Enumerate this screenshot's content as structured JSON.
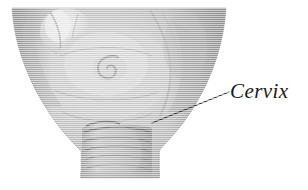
{
  "figure": {
    "type": "anatomical-illustration",
    "subject": "cervix",
    "background_color": "#ffffff",
    "style": "grayscale engraving with horizontal scanline hatching",
    "width": 308,
    "height": 190
  },
  "annotations": [
    {
      "label": "Cervix",
      "text_color": "#1a1a1a",
      "font_style": "italic-serif",
      "text_x": 231,
      "text_baseline_y": 102,
      "leader_line": {
        "from_x": 152,
        "from_y": 123,
        "to_x": 229,
        "to_y": 92,
        "color": "#262626",
        "width": 1.2
      }
    }
  ],
  "artwork": {
    "organ_fill": "#b9b9b9",
    "organ_shadow": "#8e8e8e",
    "organ_highlight": "#e2e2e2",
    "outline_color": "#6f6f6f",
    "body_top_y": 8,
    "body_left_x": 12,
    "body_right_x": 226,
    "canal_bottom_y": 178,
    "os_center_x": 110,
    "os_center_y": 65
  }
}
